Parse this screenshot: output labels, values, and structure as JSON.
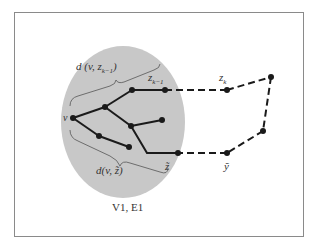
{
  "figure": {
    "caption": "V1, E1",
    "labels": {
      "v": "v",
      "z_k_minus_1": "z",
      "z_k_minus_1_sub": "k−1",
      "z_k": "z",
      "z_k_sub": "k",
      "z_tilde": "z̃",
      "y_tilde": "ỹ",
      "d_top": "d (v, z",
      "d_top_sub": "k−1",
      "d_top_close": ")",
      "d_bottom": "d(v, z̃)"
    },
    "colors": {
      "region_fill": "#c8c8c8",
      "edge": "#1a1a1a",
      "frame": "#8a8a8a"
    }
  }
}
